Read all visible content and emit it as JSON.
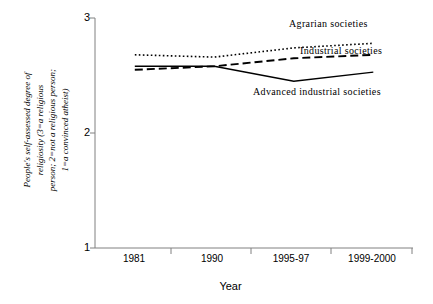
{
  "chart_data": {
    "type": "line",
    "title": "",
    "xlabel": "Year",
    "ylabel": "People's self-assessed degree of religiosity (3=a religious person; 2=not a religious person; 1=a convinced atheist)",
    "categories": [
      "1981",
      "1990",
      "1995-97",
      "1999-2000"
    ],
    "ylim": [
      1,
      3
    ],
    "yticks": [
      "1",
      "2",
      "3"
    ],
    "grid": false,
    "legend_position": "inline-annotations",
    "series": [
      {
        "name": "Agrarian societies",
        "style": "dotted",
        "color": "#000000",
        "values": [
          2.68,
          2.66,
          2.74,
          2.78
        ]
      },
      {
        "name": "Industrial societies",
        "style": "dashed",
        "color": "#000000",
        "values": [
          2.55,
          2.58,
          2.65,
          2.68
        ]
      },
      {
        "name": "Advanced industrial societies",
        "style": "solid",
        "color": "#000000",
        "values": [
          2.58,
          2.58,
          2.45,
          2.53
        ]
      }
    ]
  },
  "axis": {
    "y_title_lines": "People's self-assessed degree of\nreligiosity (3=a religious\nperson; 2=not a religious person;\n1=a convinced atheist)",
    "y_tick_top": "3",
    "y_tick_mid": "2",
    "y_tick_bottom": "1",
    "x_title": "Year",
    "x_ticks": [
      "1981",
      "1990",
      "1995-97",
      "1999-2000"
    ]
  },
  "annotations": {
    "agrarian": "Agrarian societies",
    "industrial": "Industrial societies",
    "advanced": "Advanced industrial societies"
  },
  "colors": {
    "axis": "#808080",
    "line": "#000000",
    "background": "#ffffff"
  }
}
